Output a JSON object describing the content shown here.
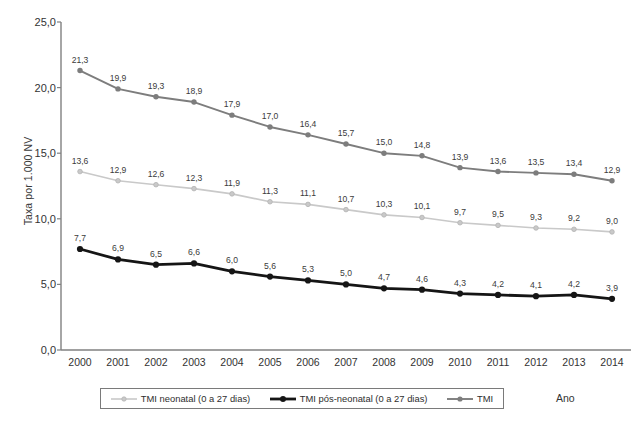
{
  "chart_data": {
    "type": "line",
    "title": "",
    "xlabel": "Ano",
    "ylabel": "Taxa por 1.000 NV",
    "categories": [
      "2000",
      "2001",
      "2002",
      "2003",
      "2004",
      "2005",
      "2006",
      "2007",
      "2008",
      "2009",
      "2010",
      "2011",
      "2012",
      "2013",
      "2014"
    ],
    "ylim": [
      0,
      25
    ],
    "ytick_values": [
      0,
      5,
      10,
      15,
      20,
      25
    ],
    "ytick_labels": [
      "0,0",
      "5,0",
      "10,0",
      "15,0",
      "20,0",
      "25,0"
    ],
    "grid": false,
    "legend_position": "bottom",
    "decimal_separator": ",",
    "series": [
      {
        "name": "TMI neonatal (0 a 27 dias)",
        "color": "#c9c9c9",
        "marker": "circle-small",
        "line_width": 1.6,
        "values": [
          13.6,
          12.9,
          12.6,
          12.3,
          11.9,
          11.3,
          11.1,
          10.7,
          10.3,
          10.1,
          9.7,
          9.5,
          9.3,
          9.2,
          9.0
        ],
        "labels": [
          "13,6",
          "12,9",
          "12,6",
          "12,3",
          "11,9",
          "11,3",
          "11,1",
          "10,7",
          "10,3",
          "10,1",
          "9,7",
          "9,5",
          "9,3",
          "9,2",
          "9,0"
        ]
      },
      {
        "name": "TMI pós-neonatal (0 a 27 dias)",
        "color": "#151515",
        "marker": "circle",
        "line_width": 2.8,
        "values": [
          7.7,
          6.9,
          6.5,
          6.6,
          6.0,
          5.6,
          5.3,
          5.0,
          4.7,
          4.6,
          4.3,
          4.2,
          4.1,
          4.2,
          3.9
        ],
        "labels": [
          "7,7",
          "6,9",
          "6,5",
          "6,6",
          "6,0",
          "5,6",
          "5,3",
          "5,0",
          "4,7",
          "4,6",
          "4,3",
          "4,2",
          "4,1",
          "4,2",
          "3,9"
        ]
      },
      {
        "name": "TMI",
        "color": "#7d7d7d",
        "marker": "circle",
        "line_width": 1.9,
        "values": [
          21.3,
          19.9,
          19.3,
          18.9,
          17.9,
          17.0,
          16.4,
          15.7,
          15.0,
          14.8,
          13.9,
          13.6,
          13.5,
          13.4,
          12.9
        ],
        "labels": [
          "21,3",
          "19,9",
          "19,3",
          "18,9",
          "17,9",
          "17,0",
          "16,4",
          "15,7",
          "15,0",
          "14,8",
          "13,9",
          "13,6",
          "13,5",
          "13,4",
          "12,9"
        ]
      }
    ]
  },
  "axis": {
    "axis_color": "#808080",
    "y_title": "Taxa por 1.000 NV",
    "x_title": "Ano"
  }
}
